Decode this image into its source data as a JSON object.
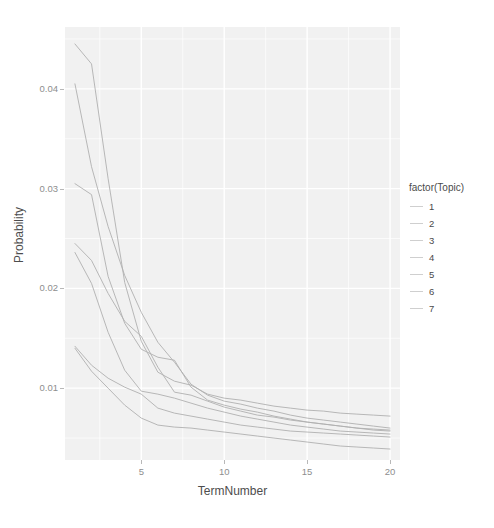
{
  "chart_data": {
    "type": "line",
    "title": "",
    "xlabel": "TermNumber",
    "ylabel": "Probability",
    "xlim": [
      0.4,
      20.6
    ],
    "ylim": [
      0.0028,
      0.0462
    ],
    "xticks": [
      5,
      10,
      15,
      20
    ],
    "xtick_labels": [
      "5",
      "10",
      "15",
      "20"
    ],
    "yticks": [
      0.01,
      0.02,
      0.03,
      0.04
    ],
    "ytick_labels": [
      "0.01",
      "0.02",
      "0.03",
      "0.04"
    ],
    "grid": true,
    "legend": {
      "title": "factor(Topic)",
      "position": "right",
      "entries": [
        {
          "label": "1",
          "color": "#cfcfcf"
        },
        {
          "label": "2",
          "color": "#cfcfcf"
        },
        {
          "label": "3",
          "color": "#cfcfcf"
        },
        {
          "label": "4",
          "color": "#cfcfcf"
        },
        {
          "label": "5",
          "color": "#cfcfcf"
        },
        {
          "label": "6",
          "color": "#cfcfcf"
        },
        {
          "label": "7",
          "color": "#cfcfcf"
        }
      ]
    },
    "x": [
      1,
      2,
      3,
      4,
      5,
      6,
      7,
      8,
      9,
      10,
      11,
      12,
      13,
      14,
      15,
      16,
      17,
      18,
      19,
      20
    ],
    "series": [
      {
        "name": "1",
        "color": "#b0b0b0",
        "values": [
          0.0445,
          0.0425,
          0.031,
          0.0206,
          0.0147,
          0.0116,
          0.0107,
          0.0103,
          0.0094,
          0.009,
          0.0088,
          0.0085,
          0.0082,
          0.008,
          0.0078,
          0.0077,
          0.0075,
          0.0074,
          0.0073,
          0.0072
        ]
      },
      {
        "name": "2",
        "color": "#b0b0b0",
        "values": [
          0.0405,
          0.0322,
          0.0262,
          0.0213,
          0.0176,
          0.0146,
          0.0126,
          0.0104,
          0.0093,
          0.0087,
          0.0084,
          0.008,
          0.0077,
          0.0073,
          0.007,
          0.0068,
          0.0066,
          0.0064,
          0.0062,
          0.006
        ]
      },
      {
        "name": "3",
        "color": "#b0b0b0",
        "values": [
          0.0305,
          0.0294,
          0.0212,
          0.0165,
          0.0139,
          0.0131,
          0.0128,
          0.0101,
          0.0088,
          0.0083,
          0.0079,
          0.0076,
          0.0072,
          0.0069,
          0.0066,
          0.0064,
          0.0062,
          0.006,
          0.0059,
          0.0058
        ]
      },
      {
        "name": "4",
        "color": "#b0b0b0",
        "values": [
          0.0245,
          0.0228,
          0.0195,
          0.0167,
          0.0152,
          0.0121,
          0.0096,
          0.0093,
          0.0087,
          0.0081,
          0.0077,
          0.0073,
          0.0071,
          0.0068,
          0.0066,
          0.0064,
          0.0062,
          0.006,
          0.0058,
          0.0057
        ]
      },
      {
        "name": "5",
        "color": "#b0b0b0",
        "values": [
          0.0236,
          0.0205,
          0.0156,
          0.0118,
          0.0097,
          0.0094,
          0.009,
          0.0085,
          0.008,
          0.0076,
          0.0072,
          0.0069,
          0.0066,
          0.0063,
          0.0061,
          0.0059,
          0.0057,
          0.0056,
          0.0055,
          0.0054
        ]
      },
      {
        "name": "6",
        "color": "#b0b0b0",
        "values": [
          0.0142,
          0.0123,
          0.011,
          0.0101,
          0.0094,
          0.008,
          0.0075,
          0.0072,
          0.0069,
          0.0066,
          0.0063,
          0.0061,
          0.0059,
          0.0057,
          0.0056,
          0.0055,
          0.0054,
          0.0053,
          0.0052,
          0.0051
        ]
      },
      {
        "name": "7",
        "color": "#b0b0b0",
        "values": [
          0.014,
          0.0117,
          0.01,
          0.0083,
          0.007,
          0.0063,
          0.0061,
          0.006,
          0.0058,
          0.0056,
          0.0054,
          0.0052,
          0.005,
          0.0048,
          0.0046,
          0.0044,
          0.0042,
          0.0041,
          0.004,
          0.0039
        ]
      }
    ],
    "style": {
      "panel_background": "#f1f1f1",
      "grid_color": "#ffffff",
      "line_color": "#b0b0b0",
      "axis_text_color": "#8e8e8e",
      "axis_title_color": "#4d4d4d"
    }
  }
}
